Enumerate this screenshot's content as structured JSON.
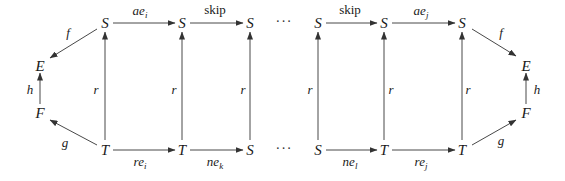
{
  "diagram": {
    "nodes": {
      "top": [
        {
          "id": "s1",
          "label": "S"
        },
        {
          "id": "s2",
          "label": "S"
        },
        {
          "id": "s3",
          "label": "S"
        },
        {
          "id": "s4",
          "label": "S"
        },
        {
          "id": "s5",
          "label": "S"
        },
        {
          "id": "s6",
          "label": "S"
        }
      ],
      "bottom": [
        {
          "id": "t1",
          "label": "T"
        },
        {
          "id": "t2",
          "label": "T"
        },
        {
          "id": "b3",
          "label": "S"
        },
        {
          "id": "b4",
          "label": "S"
        },
        {
          "id": "t5",
          "label": "T"
        },
        {
          "id": "t6",
          "label": "T"
        }
      ],
      "left": {
        "E": "E",
        "F": "F"
      },
      "right": {
        "E": "E",
        "F": "F"
      },
      "ellipsis": "···"
    },
    "edges": {
      "top": [
        {
          "base": "ae",
          "sub": "i"
        },
        {
          "base": "skip",
          "sub": ""
        },
        {
          "base": "skip",
          "sub": ""
        },
        {
          "base": "ae",
          "sub": "j"
        }
      ],
      "bottom": [
        {
          "base": "re",
          "sub": "i"
        },
        {
          "base": "ne",
          "sub": "k"
        },
        {
          "base": "ne",
          "sub": "l"
        },
        {
          "base": "re",
          "sub": "j"
        }
      ],
      "vertical_label": "r",
      "left": {
        "f": "f",
        "g": "g",
        "h": "h"
      },
      "right": {
        "f": "f",
        "g": "g",
        "h": "h"
      }
    }
  }
}
